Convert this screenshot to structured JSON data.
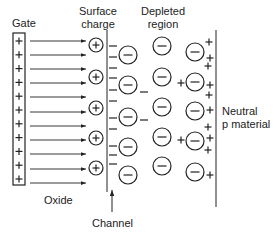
{
  "labels": {
    "gate": "Gate",
    "surface_charge_line1": "Surface",
    "surface_charge_line2": "charge",
    "depleted_line1": "Depleted",
    "depleted_line2": "region",
    "neutral_line1": "Neutral",
    "neutral_line2": "p material",
    "oxide": "Oxide",
    "channel": "Channel"
  },
  "symbols": {
    "plus": "+",
    "minus": "−"
  },
  "colors": {
    "ink": "#222222",
    "background": "#ffffff"
  },
  "gate": {
    "box": {
      "x": 13,
      "y": 33,
      "w": 12,
      "h": 152
    },
    "plus_count": 11
  },
  "field_arrows": {
    "x1": 30,
    "x2": 86,
    "ys": [
      41,
      55,
      69,
      83,
      97,
      112,
      126,
      140,
      154,
      169,
      183
    ]
  },
  "surface_charges": {
    "cx": 96,
    "r": 7,
    "ys": [
      45,
      77,
      108,
      138,
      168
    ]
  },
  "channel_line": {
    "x": 107,
    "y1": 30,
    "y2": 192
  },
  "channel_electrons": [
    {
      "x": 113,
      "y": 46
    },
    {
      "x": 113,
      "y": 57
    },
    {
      "x": 113,
      "y": 68
    },
    {
      "x": 113,
      "y": 78
    },
    {
      "x": 113,
      "y": 90
    },
    {
      "x": 113,
      "y": 101
    },
    {
      "x": 113,
      "y": 118
    },
    {
      "x": 113,
      "y": 129
    },
    {
      "x": 113,
      "y": 146
    },
    {
      "x": 113,
      "y": 155
    },
    {
      "x": 113,
      "y": 164
    },
    {
      "x": 144,
      "y": 92
    },
    {
      "x": 144,
      "y": 120
    }
  ],
  "ionized_acceptors": [
    {
      "cx": 128,
      "cy": 55
    },
    {
      "cx": 128,
      "cy": 85
    },
    {
      "cx": 128,
      "cy": 117
    },
    {
      "cx": 128,
      "cy": 147
    },
    {
      "cx": 128,
      "cy": 175
    },
    {
      "cx": 162,
      "cy": 46
    },
    {
      "cx": 162,
      "cy": 77
    },
    {
      "cx": 162,
      "cy": 107
    },
    {
      "cx": 162,
      "cy": 137
    },
    {
      "cx": 162,
      "cy": 166
    },
    {
      "cx": 195,
      "cy": 52
    },
    {
      "cx": 195,
      "cy": 82
    },
    {
      "cx": 195,
      "cy": 111
    },
    {
      "cx": 195,
      "cy": 141
    },
    {
      "cx": 195,
      "cy": 172
    }
  ],
  "acceptor_radius": 9,
  "holes": [
    {
      "x": 209,
      "y": 42
    },
    {
      "x": 210,
      "y": 58
    },
    {
      "x": 208,
      "y": 66
    },
    {
      "x": 210,
      "y": 85
    },
    {
      "x": 209,
      "y": 95
    },
    {
      "x": 181,
      "y": 83
    },
    {
      "x": 210,
      "y": 110
    },
    {
      "x": 208,
      "y": 127
    },
    {
      "x": 210,
      "y": 138
    },
    {
      "x": 208,
      "y": 150
    },
    {
      "x": 181,
      "y": 140
    },
    {
      "x": 210,
      "y": 175
    }
  ],
  "boundary_line": {
    "x": 216,
    "y1": 30,
    "y2": 207
  },
  "channel_arrow": {
    "x": 112,
    "y1": 212,
    "y2": 190
  }
}
